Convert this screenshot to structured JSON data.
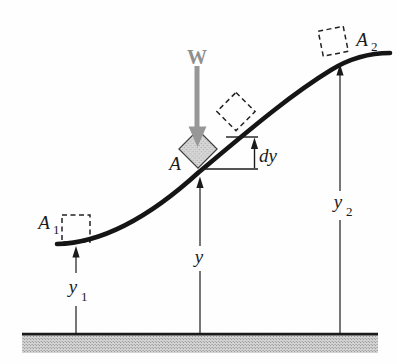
{
  "figure": {
    "type": "physics-diagram-work-gravity-curved-path",
    "labels": {
      "weight": "W",
      "block_mid": "A",
      "block_left": {
        "main": "A",
        "sub": "1"
      },
      "block_right": {
        "main": "A",
        "sub": "2"
      },
      "height_mid": "y",
      "height_left": {
        "main": "y",
        "sub": "1"
      },
      "height_right": {
        "main": "y",
        "sub": "2"
      },
      "differential": "dy"
    },
    "colors": {
      "curve": "#151515",
      "weight_gray": "#979797",
      "weight_label_gray": "#8f8f8f",
      "block_fill_gray": "#cdcdcd",
      "ground_gray": "#c6c6c6",
      "line_black": "#1b1b1b"
    }
  }
}
